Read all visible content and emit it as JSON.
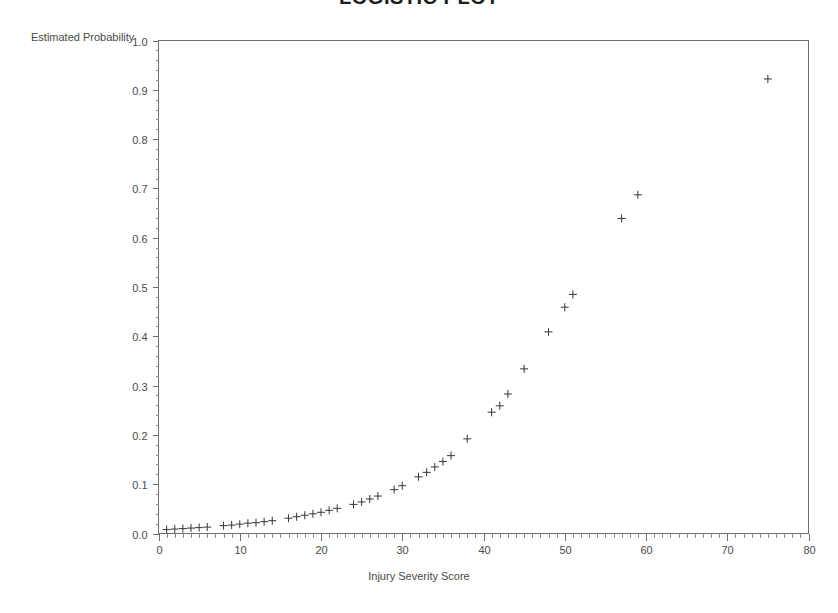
{
  "chart_data": {
    "type": "scatter",
    "title": "LOGISTIC PLOT",
    "xlabel": "Injury Severity Score",
    "ylabel": "Estimated Probability",
    "xlim": [
      0,
      80
    ],
    "ylim": [
      0.0,
      1.0
    ],
    "grid": false,
    "legend": null,
    "marker": "plus",
    "marker_color": "#3d3d3d",
    "x_ticks": [
      0,
      10,
      20,
      30,
      40,
      50,
      60,
      70,
      80
    ],
    "x_tick_labels": [
      "0",
      "10",
      "20",
      "30",
      "40",
      "50",
      "60",
      "70",
      "80"
    ],
    "x_minor_step": 1,
    "y_ticks": [
      0.0,
      0.1,
      0.2,
      0.3,
      0.4,
      0.5,
      0.6,
      0.7,
      0.8,
      0.9,
      1.0
    ],
    "y_tick_labels": [
      "0.0",
      "0.1",
      "0.2",
      "0.3",
      "0.4",
      "0.5",
      "0.6",
      "0.7",
      "0.8",
      "0.9",
      "1.0"
    ],
    "y_minor_step": 0.02,
    "x": [
      1,
      2,
      3,
      4,
      5,
      6,
      8,
      9,
      10,
      11,
      12,
      13,
      14,
      16,
      17,
      18,
      19,
      20,
      21,
      22,
      24,
      25,
      26,
      27,
      29,
      30,
      32,
      33,
      34,
      35,
      36,
      38,
      41,
      42,
      43,
      45,
      48,
      50,
      51,
      57,
      59,
      75
    ],
    "y": [
      0.008,
      0.009,
      0.01,
      0.011,
      0.012,
      0.013,
      0.016,
      0.017,
      0.019,
      0.021,
      0.022,
      0.024,
      0.026,
      0.031,
      0.034,
      0.037,
      0.04,
      0.043,
      0.047,
      0.051,
      0.059,
      0.064,
      0.07,
      0.076,
      0.089,
      0.097,
      0.115,
      0.124,
      0.135,
      0.146,
      0.158,
      0.192,
      0.246,
      0.259,
      0.283,
      0.334,
      0.409,
      0.459,
      0.485,
      0.639,
      0.687,
      0.922
    ]
  }
}
